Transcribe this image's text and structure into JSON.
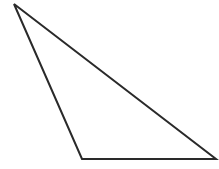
{
  "diagram": {
    "type": "triangle",
    "vertices": [
      [
        14,
        4
      ],
      [
        82,
        159
      ],
      [
        216,
        159
      ]
    ],
    "stroke": "#2a2a2a",
    "fill": "#ffffff",
    "stroke_width": 2
  }
}
